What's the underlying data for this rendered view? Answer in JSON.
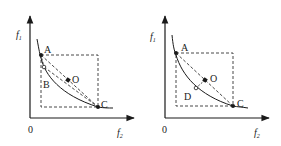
{
  "diagrams": [
    {
      "id": "left",
      "axes": {
        "y_label": "f",
        "y_sub": "1",
        "x_label": "f",
        "x_sub": "2",
        "origin": "0"
      },
      "points": {
        "A": {
          "label": "A",
          "type": "filled"
        },
        "C": {
          "label": "C",
          "type": "filled"
        },
        "O": {
          "label": "O",
          "type": "filled"
        },
        "B": {
          "label": "B",
          "type": "hollow"
        }
      },
      "elements": [
        "pareto-curve",
        "dashed-rectangle",
        "dashed-line-A-C",
        "dashed-line-B-C",
        "dashed-line-A-O"
      ]
    },
    {
      "id": "right",
      "axes": {
        "y_label": "f",
        "y_sub": "1",
        "x_label": "f",
        "x_sub": "2",
        "origin": "0"
      },
      "points": {
        "A": {
          "label": "A",
          "type": "filled"
        },
        "C": {
          "label": "C",
          "type": "filled"
        },
        "O": {
          "label": "O",
          "type": "filled"
        },
        "D": {
          "label": "D",
          "type": "hollow"
        }
      },
      "elements": [
        "pareto-curve",
        "dashed-rectangle",
        "dashed-line-A-C",
        "dashed-line-O-D"
      ]
    }
  ],
  "colors": {
    "line": "#1a1a1a",
    "dashed": "#333333",
    "background": "#ffffff"
  }
}
